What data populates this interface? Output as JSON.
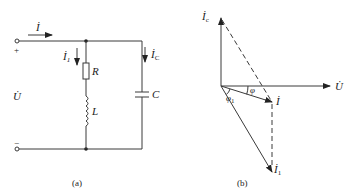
{
  "figure": {
    "panel_a": {
      "caption": "(a)",
      "labels": {
        "total_current": "İ",
        "branch1_current": "İ",
        "branch1_sub": "1",
        "cap_current": "İ",
        "cap_sub": "C",
        "voltage": "U̇",
        "resistor": "R",
        "inductor": "L",
        "capacitor": "C",
        "plus": "+",
        "minus": "−"
      }
    },
    "panel_b": {
      "caption": "(b)",
      "labels": {
        "ic": "İ",
        "ic_sub": "c",
        "u": "U̇",
        "i": "İ",
        "i1": "İ",
        "i1_sub": "1",
        "phi": "φ",
        "phi1": "φ",
        "phi1_sub": "1"
      }
    },
    "colors": {
      "line": "#3a3a3a",
      "text": "#222222",
      "background": "#ffffff"
    }
  }
}
